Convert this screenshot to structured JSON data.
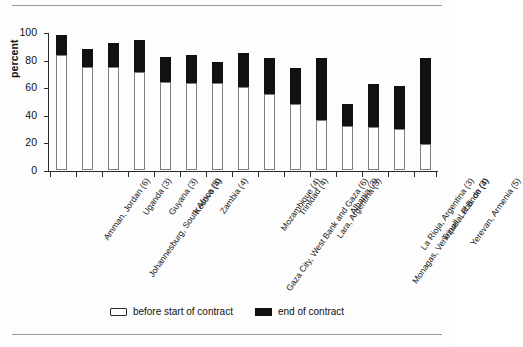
{
  "chart_data": {
    "type": "bar",
    "subtype": "stacked-vertical",
    "title": "",
    "xlabel": "",
    "ylabel": "percent",
    "ylim": [
      0,
      100
    ],
    "yticks": [
      0,
      20,
      40,
      60,
      80,
      100
    ],
    "grid": false,
    "legend_position": "bottom-center",
    "categories": [
      "Amman, Jordan (6)",
      "Johannesburg, South Africa (5)",
      "Uganda (3)",
      "Guyana (3)",
      "Kosovo (4)",
      "Zambia (4)",
      "Gaza City, West Bank and Gaza (6)",
      "Mozambique (4)",
      "Trinidad (4)",
      "Lara, Argentina (3)",
      "Albania (3)",
      "Monagas, Venezuela, R.B. de (4)",
      "La Rioja, Argentina (3)",
      "Tripoli, Lebanon (3)",
      "Yerevan, Armenia (5)"
    ],
    "series": [
      {
        "name": "before start of contract",
        "color": "#ffffff",
        "values": [
          83,
          75,
          75,
          71,
          64,
          63,
          63,
          60,
          55,
          48,
          36,
          32,
          31,
          30,
          19
        ]
      },
      {
        "name": "end of contract",
        "color": "#111111",
        "values": [
          15,
          13,
          17,
          23,
          18,
          20,
          15,
          25,
          26,
          26,
          45,
          16,
          31,
          31,
          62
        ]
      }
    ],
    "totals": [
      98,
      88,
      92,
      94,
      82,
      83,
      78,
      85,
      81,
      74,
      81,
      48,
      62,
      61,
      81
    ]
  },
  "axes": {
    "y_axis_label": "percent",
    "y_tick_labels": [
      "0",
      "20",
      "40",
      "60",
      "80",
      "100"
    ]
  },
  "legend": {
    "items": [
      {
        "label": "before start of contract",
        "swatch": "white"
      },
      {
        "label": "end of contract",
        "swatch": "black"
      }
    ]
  }
}
